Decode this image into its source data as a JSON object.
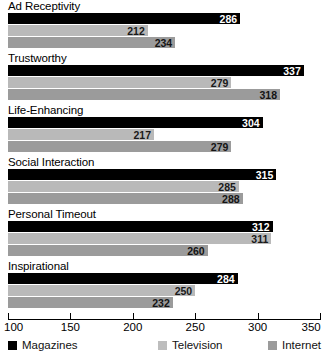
{
  "chart_data": {
    "type": "bar",
    "orientation": "horizontal",
    "grouped": true,
    "title": "",
    "subtitle": "",
    "xlabel": "",
    "ylabel": "",
    "xlim": [
      100,
      350
    ],
    "xticks": [
      100,
      150,
      200,
      250,
      300,
      350
    ],
    "xtick_labels": [
      "100",
      "150",
      "200",
      "250",
      "300",
      "350"
    ],
    "grid": false,
    "legend_position": "bottom",
    "categories": [
      "Ad Receptivity",
      "Trustworthy",
      "Life-Enhancing",
      "Social Interaction",
      "Personal Timeout",
      "Inspirational"
    ],
    "series": [
      {
        "name": "Magazines",
        "color": "#000000",
        "values": [
          286,
          337,
          304,
          315,
          312,
          284
        ]
      },
      {
        "name": "Television",
        "color": "#bdbdbd",
        "values": [
          212,
          279,
          217,
          285,
          311,
          250
        ]
      },
      {
        "name": "Internet",
        "color": "#9b9b9b",
        "values": [
          234,
          318,
          279,
          288,
          260,
          232
        ]
      }
    ]
  },
  "legend": {
    "items": [
      {
        "label": "Magazines",
        "swatch_class": "series-magazines"
      },
      {
        "label": "Television",
        "swatch_class": "series-television"
      },
      {
        "label": "Internet",
        "swatch_class": "series-internet"
      }
    ]
  }
}
